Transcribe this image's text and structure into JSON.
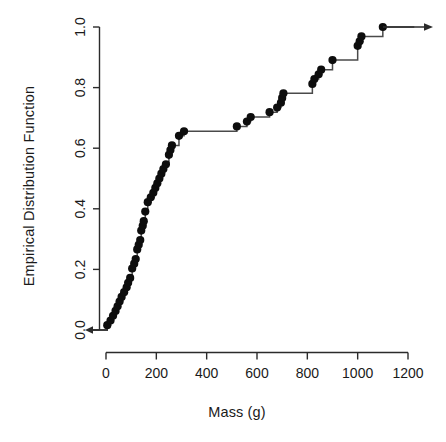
{
  "figure": {
    "background_color": "#ffffff",
    "foreground_color": "#000000",
    "point_color": "#0d0d0d",
    "line_color": "#4a4a4a"
  },
  "chart_data": {
    "type": "line",
    "subtype": "ecdf-step",
    "title": "",
    "subtitle": "",
    "xlabel": "Mass (g)",
    "ylabel": "Empirical Distribution Function",
    "xlim": [
      -60,
      1230
    ],
    "ylim": [
      0.0,
      1.0
    ],
    "xticks": [
      0,
      200,
      400,
      600,
      800,
      1000,
      1200
    ],
    "xticklabels": [
      "0",
      "200",
      "400",
      "600",
      "800",
      "1000",
      "1200"
    ],
    "yticks": [
      0.0,
      0.2,
      0.4,
      0.6,
      0.8,
      1.0
    ],
    "yticklabels": [
      "0.0",
      "0.2",
      "0.4",
      "0.6",
      "0.8",
      "1.0"
    ],
    "grid": false,
    "legend": false,
    "legend_position": "none",
    "n_observations": 59,
    "left_tail_arrow": true,
    "right_tail_arrow": true,
    "annotations": [
      {
        "name": "left-tail-arrow",
        "x": -55,
        "y": 0.0,
        "direction": "left"
      },
      {
        "name": "right-tail-arrow",
        "x": 1225,
        "y": 1.0,
        "direction": "right"
      }
    ],
    "x": [
      5,
      18,
      28,
      38,
      46,
      54,
      62,
      68,
      74,
      80,
      86,
      92,
      98,
      104,
      110,
      116,
      121,
      126,
      131,
      136,
      140,
      144,
      148,
      152,
      160,
      168,
      176,
      184,
      192,
      198,
      204,
      210,
      216,
      222,
      228,
      234,
      240,
      246,
      252,
      258,
      264,
      270,
      282,
      294,
      306,
      318,
      520,
      545,
      570,
      650,
      672,
      690,
      700,
      706,
      712,
      820,
      838,
      852,
      866,
      900,
      1000,
      1012,
      1020,
      1100
    ],
    "y": [
      0.016,
      0.031,
      0.047,
      0.063,
      0.078,
      0.094,
      0.109,
      0.125,
      0.141,
      0.156,
      0.172,
      0.188,
      0.203,
      0.219,
      0.234,
      0.25,
      0.266,
      0.281,
      0.297,
      0.312,
      0.328,
      0.344,
      0.359,
      0.375,
      0.391,
      0.406,
      0.422,
      0.438,
      0.453,
      0.469,
      0.484,
      0.5,
      0.516,
      0.531,
      0.547,
      0.562,
      0.578,
      0.594,
      0.609,
      0.625,
      0.641,
      0.656,
      0.656,
      0.656,
      0.656,
      0.659,
      0.672,
      0.688,
      0.703,
      0.719,
      0.734,
      0.75,
      0.766,
      0.781,
      0.781,
      0.812,
      0.828,
      0.844,
      0.859,
      0.891,
      0.938,
      0.953,
      0.969,
      1.0
    ],
    "points": [
      {
        "mass": 5,
        "f": 0.016
      },
      {
        "mass": 18,
        "f": 0.031
      },
      {
        "mass": 28,
        "f": 0.047
      },
      {
        "mass": 38,
        "f": 0.063
      },
      {
        "mass": 46,
        "f": 0.078
      },
      {
        "mass": 54,
        "f": 0.094
      },
      {
        "mass": 62,
        "f": 0.109
      },
      {
        "mass": 72,
        "f": 0.125
      },
      {
        "mass": 82,
        "f": 0.141
      },
      {
        "mass": 88,
        "f": 0.156
      },
      {
        "mass": 96,
        "f": 0.172
      },
      {
        "mass": 104,
        "f": 0.203
      },
      {
        "mass": 112,
        "f": 0.219
      },
      {
        "mass": 118,
        "f": 0.234
      },
      {
        "mass": 124,
        "f": 0.266
      },
      {
        "mass": 130,
        "f": 0.281
      },
      {
        "mass": 136,
        "f": 0.297
      },
      {
        "mass": 140,
        "f": 0.328
      },
      {
        "mass": 146,
        "f": 0.344
      },
      {
        "mass": 150,
        "f": 0.359
      },
      {
        "mass": 156,
        "f": 0.391
      },
      {
        "mass": 166,
        "f": 0.422
      },
      {
        "mass": 178,
        "f": 0.438
      },
      {
        "mass": 188,
        "f": 0.453
      },
      {
        "mass": 196,
        "f": 0.469
      },
      {
        "mass": 204,
        "f": 0.484
      },
      {
        "mass": 212,
        "f": 0.5
      },
      {
        "mass": 220,
        "f": 0.516
      },
      {
        "mass": 228,
        "f": 0.531
      },
      {
        "mass": 238,
        "f": 0.547
      },
      {
        "mass": 250,
        "f": 0.578
      },
      {
        "mass": 256,
        "f": 0.594
      },
      {
        "mass": 262,
        "f": 0.609
      },
      {
        "mass": 290,
        "f": 0.641
      },
      {
        "mass": 310,
        "f": 0.656
      },
      {
        "mass": 520,
        "f": 0.672
      },
      {
        "mass": 560,
        "f": 0.688
      },
      {
        "mass": 575,
        "f": 0.703
      },
      {
        "mass": 650,
        "f": 0.719
      },
      {
        "mass": 680,
        "f": 0.734
      },
      {
        "mass": 695,
        "f": 0.75
      },
      {
        "mass": 700,
        "f": 0.766
      },
      {
        "mass": 705,
        "f": 0.781
      },
      {
        "mass": 820,
        "f": 0.812
      },
      {
        "mass": 828,
        "f": 0.828
      },
      {
        "mass": 845,
        "f": 0.844
      },
      {
        "mass": 855,
        "f": 0.859
      },
      {
        "mass": 900,
        "f": 0.891
      },
      {
        "mass": 1000,
        "f": 0.938
      },
      {
        "mass": 1008,
        "f": 0.953
      },
      {
        "mass": 1015,
        "f": 0.969
      },
      {
        "mass": 1100,
        "f": 1.0
      }
    ]
  },
  "axes": {
    "x_axis_name": "mass-axis",
    "y_axis_name": "ecdf-axis"
  }
}
